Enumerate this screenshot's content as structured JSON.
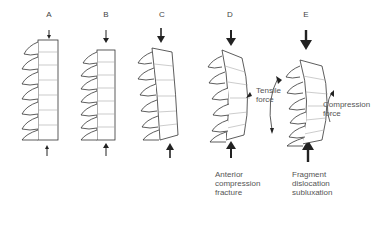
{
  "panels": [
    {
      "id": "A",
      "label": "A",
      "force": "small axial load"
    },
    {
      "id": "B",
      "label": "B",
      "force": "moderate axial load"
    },
    {
      "id": "C",
      "label": "C",
      "force": "larger axial load"
    },
    {
      "id": "D",
      "label": "D",
      "caption": "Anterior\ncompression\nfracture"
    },
    {
      "id": "E",
      "label": "E",
      "caption": "Fragment\ndislocation\nsubluxation",
      "annotations": {
        "tensile": "Tensile\nforce",
        "compression": "Compression\nforce"
      }
    }
  ]
}
